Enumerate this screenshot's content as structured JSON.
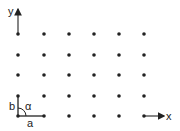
{
  "diagram": {
    "axes": {
      "x_label": "x",
      "y_label": "y"
    },
    "lattice": {
      "columns_x": [
        18,
        44,
        69,
        94,
        119,
        144
      ],
      "rows_y": [
        34,
        55,
        75,
        96,
        116
      ]
    },
    "unit_cell": {
      "a_label": "a",
      "b_label": "b",
      "angle_label": "α"
    },
    "colors": {
      "ink": "#222222",
      "background": "#ffffff"
    }
  }
}
